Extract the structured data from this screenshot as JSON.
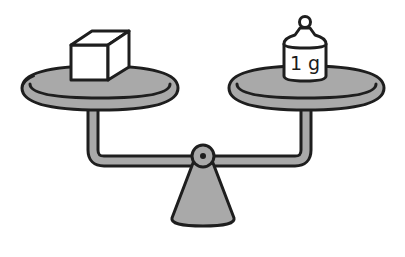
{
  "diagram": {
    "left_pan": {
      "object": "cube",
      "label": ""
    },
    "right_pan": {
      "object": "weight",
      "label": "1 g"
    },
    "colors": {
      "outline": "#1e1e1e",
      "pan_fill": "#a9a9a9",
      "object_fill": "#ffffff",
      "background": "#ffffff"
    }
  }
}
